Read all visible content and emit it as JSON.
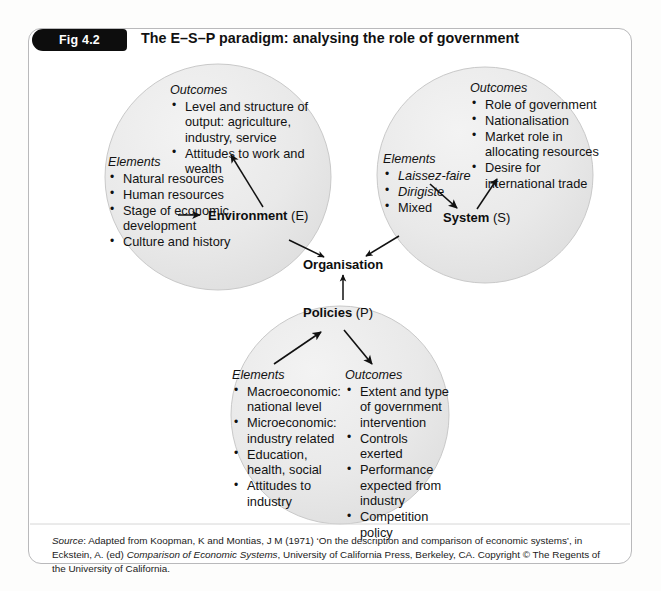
{
  "figure": {
    "badge": "Fig 4.2",
    "title": "The E–S–P paradigm: analysing the role of government",
    "frame_border_color": "#b9b9bb",
    "badge_background": "#0d0d0d",
    "circle_fill": "#ebebeb"
  },
  "center_node": {
    "label": "Organisation"
  },
  "circles": [
    {
      "id": "environment",
      "node_label_main": "Environment",
      "node_label_suffix": "(E)",
      "outcomes_heading": "Outcomes",
      "outcomes": [
        "Level and structure of output: agriculture, industry, service",
        "Attitudes to work and wealth"
      ],
      "elements_heading": "Elements",
      "elements": [
        "Natural resources",
        "Human resources",
        "Stage of economic development",
        "Culture and history"
      ]
    },
    {
      "id": "system",
      "node_label_main": "System",
      "node_label_suffix": "(S)",
      "outcomes_heading": "Outcomes",
      "outcomes": [
        "Role of government",
        "Nationalisation",
        "Market role in allocating resources",
        "Desire for international trade"
      ],
      "elements_heading": "Elements",
      "elements": [
        "Laissez-faire",
        "Dirigiste",
        "Mixed"
      ],
      "elements_italic": [
        true,
        true,
        false
      ]
    },
    {
      "id": "policies",
      "node_label_main": "Policies",
      "node_label_suffix": "(P)",
      "elements_heading": "Elements",
      "elements": [
        "Macroeconomic: national level",
        "Microeconomic: industry related",
        "Education, health, social",
        "Attitudes to industry"
      ],
      "outcomes_heading": "Outcomes",
      "outcomes": [
        "Extent and type of government intervention",
        "Controls exerted",
        "Performance expected from industry",
        "Competition policy"
      ]
    }
  ],
  "source": {
    "label": "Source",
    "text_1": ": Adapted from Koopman, K and Montias, J M (1971) ‘On the description and comparison of economic systems’, in Eckstein, A. (ed) ",
    "title_italic": "Comparison of Economic Systems",
    "text_2": ", University of California Press, Berkeley, CA. Copyright © The Regents of the University of California."
  }
}
